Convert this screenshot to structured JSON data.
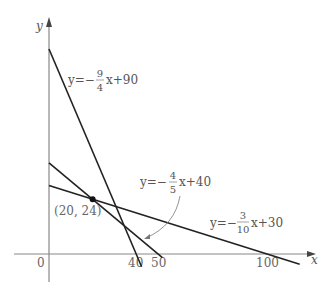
{
  "diagram": {
    "type": "coordinate-plane-linear-equations",
    "axes": {
      "x_label": "x",
      "y_label": "y",
      "origin_label": "0",
      "x_ticks": [
        "40",
        "50",
        "100"
      ]
    },
    "lines": [
      {
        "id": "line1",
        "equation_prefix": "y=−",
        "numerator": "9",
        "denominator": "4",
        "suffix": "x+90",
        "slope": -2.25,
        "intercept": 90
      },
      {
        "id": "line2",
        "equation_prefix": "y=−",
        "numerator": "4",
        "denominator": "5",
        "suffix": "x+40",
        "slope": -0.8,
        "intercept": 40
      },
      {
        "id": "line3",
        "equation_prefix": "y=−",
        "numerator": "3",
        "denominator": "10",
        "suffix": "x+30",
        "slope": -0.3,
        "intercept": 30
      }
    ],
    "point": {
      "label": "(20, 24)",
      "x": 20,
      "y": 24
    },
    "colors": {
      "line": "#222222",
      "axis": "#888888",
      "text": "#555555"
    }
  }
}
